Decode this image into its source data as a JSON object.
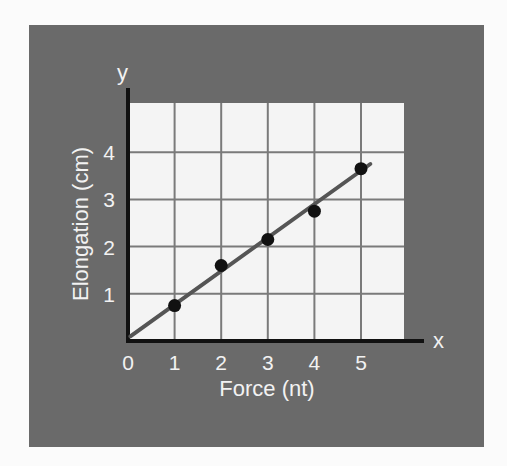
{
  "colors": {
    "page_bg": "#fbfbfb",
    "panel_bg": "#6a6a6a",
    "plot_bg": "#f4f4f4",
    "grid": "#7a7a7a",
    "axis": "#111111",
    "line": "#555555",
    "points": "#111111",
    "text": "#f2f2f2"
  },
  "chart_data": {
    "type": "scatter",
    "title": "",
    "xlabel": "Force (nt)",
    "ylabel": "Elongation (cm)",
    "x_axis_letter": "x",
    "y_axis_letter": "y",
    "x_ticks": [
      "0",
      "1",
      "2",
      "3",
      "4",
      "5"
    ],
    "y_ticks": [
      "1",
      "2",
      "3",
      "4"
    ],
    "xlim": [
      0,
      6.3
    ],
    "ylim": [
      0,
      5.0
    ],
    "grid": true,
    "legend": null,
    "series": [
      {
        "name": "Measured points",
        "type": "scatter",
        "x": [
          1,
          2,
          3,
          4,
          5
        ],
        "y": [
          0.75,
          1.6,
          2.15,
          2.75,
          3.65
        ]
      },
      {
        "name": "Best-fit line",
        "type": "line",
        "x": [
          0.05,
          5.2
        ],
        "y": [
          0.1,
          3.75
        ]
      }
    ]
  }
}
